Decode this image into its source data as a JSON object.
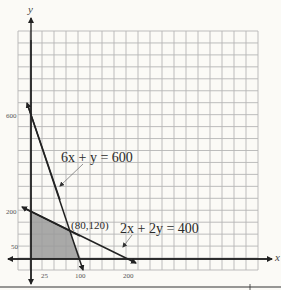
{
  "chart_data": {
    "type": "line",
    "title": "",
    "xlabel": "x",
    "ylabel": "y",
    "x_ticks": [
      25,
      100,
      200
    ],
    "y_ticks": [
      50,
      200,
      600
    ],
    "grid": true,
    "series": [
      {
        "name": "6x + y = 600",
        "points": [
          [
            0,
            600
          ],
          [
            100,
            0
          ]
        ]
      },
      {
        "name": "2x + 2y = 400",
        "points": [
          [
            0,
            200
          ],
          [
            200,
            0
          ]
        ]
      }
    ],
    "feasible_region": [
      [
        0,
        0
      ],
      [
        0,
        200
      ],
      [
        80,
        120
      ],
      [
        100,
        0
      ]
    ],
    "annotations": [
      {
        "text": "(80,120)",
        "x": 80,
        "y": 120
      },
      {
        "text": "6x + y = 600"
      },
      {
        "text": "2x + 2y = 400"
      }
    ]
  },
  "labels": {
    "x_axis": "x",
    "y_axis": "y",
    "x_tick_25": "25",
    "x_tick_100": "100",
    "x_tick_200": "200",
    "y_tick_50": "50",
    "y_tick_200": "200",
    "y_tick_600": "600",
    "eq1": "6x + y = 600",
    "eq2": "2x + 2y = 400",
    "intersection": "(80,120)"
  },
  "colors": {
    "grid": "#b5b5b5",
    "axis": "#222222",
    "shade": "#9a9a9a",
    "background": "#fbfaf6"
  }
}
